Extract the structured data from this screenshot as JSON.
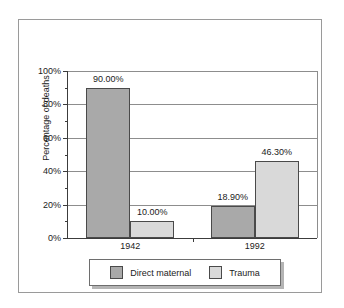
{
  "chart_data": {
    "type": "bar",
    "title": "",
    "subtitle": "",
    "xlabel": "",
    "ylabel": "Percentage of deaths",
    "categories": [
      "1942",
      "1992"
    ],
    "series": [
      {
        "name": "Direct maternal",
        "color": "#a9a9a9",
        "values": [
          90.0,
          18.9
        ],
        "labels": [
          "90.00%",
          "18.90%"
        ]
      },
      {
        "name": "Trauma",
        "color": "#d9d9d9",
        "values": [
          10.0,
          46.3
        ],
        "labels": [
          "10.00%",
          "46.30%"
        ]
      }
    ],
    "ylim": [
      0,
      100
    ],
    "y_ticks": [
      0,
      20,
      40,
      60,
      80,
      100
    ],
    "y_tick_labels": [
      "0%",
      "20%",
      "40%",
      "60%",
      "80%",
      "100%"
    ],
    "y_minor_ticks": [
      10,
      30,
      50,
      70,
      90
    ],
    "grid": "horizontal-major",
    "legend_position": "bottom-center",
    "legend_entries": [
      "Direct maternal",
      "Trauma"
    ]
  }
}
